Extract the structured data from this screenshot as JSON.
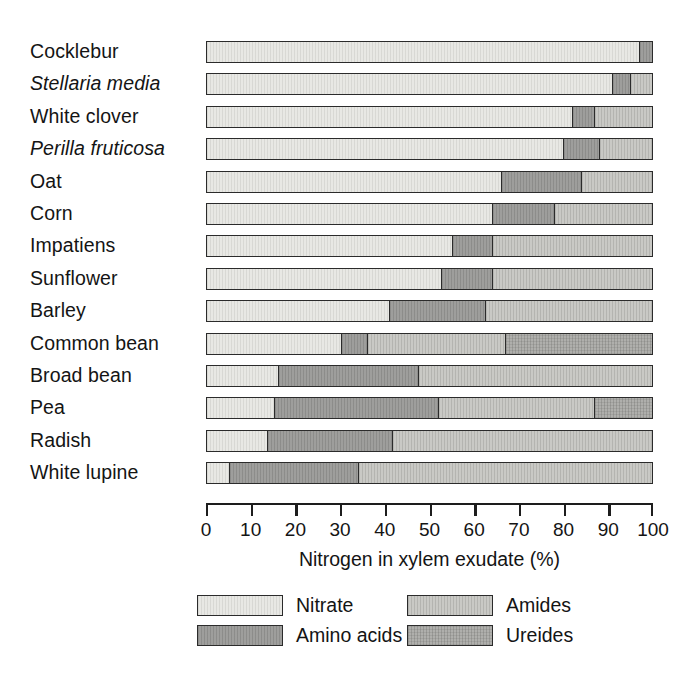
{
  "chart_data": {
    "type": "bar",
    "orientation": "horizontal",
    "stacked": true,
    "title": "",
    "xlabel": "Nitrogen in xylem exudate (%)",
    "ylabel": "",
    "xlim": [
      0,
      100
    ],
    "xticks": [
      0,
      10,
      20,
      30,
      40,
      50,
      60,
      70,
      80,
      90,
      100
    ],
    "xtick_labels": [
      "0",
      "10",
      "20",
      "30",
      "40",
      "50",
      "60",
      "70",
      "80",
      "90",
      "100"
    ],
    "grid": false,
    "legend_position": "below-axis",
    "categories": [
      "Cocklebur",
      "Stellaria media",
      "White clover",
      "Perilla fruticosa",
      "Oat",
      "Corn",
      "Impatiens",
      "Sunflower",
      "Barley",
      "Common bean",
      "Broad bean",
      "Pea",
      "Radish",
      "White lupine"
    ],
    "category_styles": [
      "normal",
      "italic",
      "normal",
      "italic",
      "normal",
      "normal",
      "normal",
      "normal",
      "normal",
      "normal",
      "normal",
      "normal",
      "normal",
      "normal"
    ],
    "series": [
      {
        "name": "Nitrate",
        "color": "#e8e8e4",
        "values": [
          97,
          91,
          82,
          80,
          66,
          64,
          55,
          52.5,
          41,
          30,
          16,
          15,
          13.5,
          5
        ]
      },
      {
        "name": "Amino acids",
        "color": "#9e9e9c",
        "values": [
          3,
          4,
          5,
          8,
          18,
          14,
          9,
          11.5,
          21.5,
          6,
          31.5,
          37,
          28,
          29
        ]
      },
      {
        "name": "Amides",
        "color": "#c9c9c5",
        "values": [
          0,
          5,
          13,
          12,
          16,
          22,
          36,
          36,
          37.5,
          31,
          52.5,
          35,
          58.5,
          66
        ]
      },
      {
        "name": "Ureides",
        "color": "#afafac",
        "values": [
          0,
          0,
          0,
          0,
          0,
          0,
          0,
          0,
          0,
          33,
          0,
          13,
          0,
          0
        ]
      }
    ]
  },
  "legend": {
    "items": [
      {
        "label": "Nitrate",
        "key": "nitrate"
      },
      {
        "label": "Amides",
        "key": "amides"
      },
      {
        "label": "Amino acids",
        "key": "amino"
      },
      {
        "label": "Ureides",
        "key": "ureides"
      }
    ]
  },
  "caption": {
    "text": ""
  }
}
